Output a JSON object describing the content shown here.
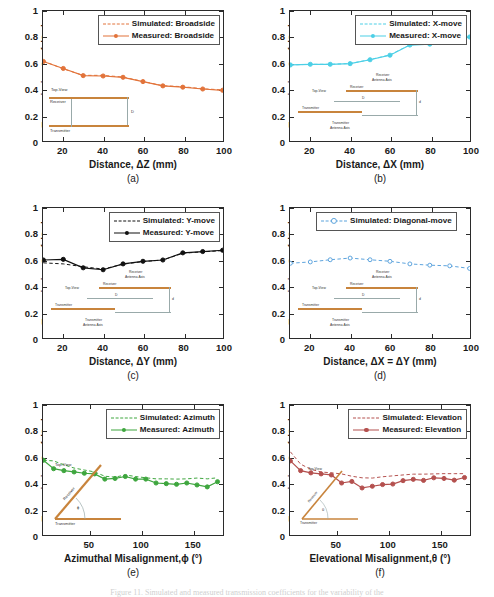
{
  "figure": {
    "ylabel": "Transmission Coef.,|S",
    "ylabel_sub": "21",
    "ylabel_end": "|",
    "caption": "Figure 11. Simulated and measured transmission coefficients for the variability of the"
  },
  "chart_data": [
    {
      "type": "line",
      "panel": "a",
      "panel_label": "(a)",
      "title": "",
      "xlabel": "Distance, ΔZ (mm)",
      "ylabel": "Transmission Coef.,|S21|",
      "xlim": [
        10,
        100
      ],
      "ylim": [
        0,
        1
      ],
      "xticks": [
        20,
        40,
        60,
        80,
        100
      ],
      "yticks": [
        0,
        0.2,
        0.4,
        0.6,
        0.8,
        1
      ],
      "x": [
        10,
        20,
        30,
        40,
        50,
        60,
        70,
        80,
        90,
        100
      ],
      "legend_position": "top-right",
      "color_measured": "#E2733A",
      "color_simulated": "#E2733A",
      "series": [
        {
          "name": "Simulated: Broadside",
          "style": "dashed",
          "marker": "none",
          "values": [
            0.615,
            0.555,
            0.505,
            0.505,
            0.492,
            0.458,
            0.425,
            0.418,
            0.402,
            0.393
          ]
        },
        {
          "name": "Measured: Broadside",
          "style": "solid",
          "marker": "filled-circle",
          "values": [
            0.612,
            0.558,
            0.503,
            0.5,
            0.49,
            0.457,
            0.424,
            0.414,
            0.4,
            0.39
          ]
        }
      ],
      "inset": {
        "labels": [
          "Top-View",
          "Receiver",
          "D",
          "Transmitter"
        ]
      }
    },
    {
      "type": "line",
      "panel": "b",
      "panel_label": "(b)",
      "xlabel": "Distance, ΔX (mm)",
      "ylabel": "Transmission Coef.,|S21|",
      "xlim": [
        10,
        100
      ],
      "ylim": [
        0,
        1
      ],
      "xticks": [
        20,
        40,
        60,
        80,
        100
      ],
      "yticks": [
        0,
        0.2,
        0.4,
        0.6,
        0.8,
        1
      ],
      "x": [
        10,
        20,
        30,
        40,
        50,
        60,
        70,
        80,
        90,
        100
      ],
      "legend_position": "top-right",
      "color_measured": "#4CCFE6",
      "color_simulated": "#4CCFE6",
      "series": [
        {
          "name": "Simulated: X-move",
          "style": "dashed",
          "marker": "none",
          "values": [
            0.585,
            0.59,
            0.59,
            0.596,
            0.626,
            0.662,
            0.74,
            0.748,
            0.806,
            0.8
          ]
        },
        {
          "name": "Measured: X-move",
          "style": "solid",
          "marker": "filled-circle",
          "values": [
            0.585,
            0.59,
            0.59,
            0.595,
            0.625,
            0.66,
            0.738,
            0.745,
            0.805,
            0.8
          ]
        }
      ],
      "inset": {
        "labels": [
          "Top-View",
          "Receiver Antenna Axis",
          "Receiver",
          "D",
          "Transmitter",
          "Transmitter Antenna Axis",
          "d"
        ]
      }
    },
    {
      "type": "line",
      "panel": "c",
      "panel_label": "(c)",
      "xlabel": "Distance, ΔY (mm)",
      "ylabel": "Transmission Coef.,|S21|",
      "xlim": [
        10,
        100
      ],
      "ylim": [
        0,
        1
      ],
      "xticks": [
        20,
        40,
        60,
        80,
        100
      ],
      "yticks": [
        0,
        0.2,
        0.4,
        0.6,
        0.8,
        1
      ],
      "x": [
        10,
        20,
        30,
        40,
        50,
        60,
        70,
        80,
        90,
        100
      ],
      "legend_position": "top-right",
      "color_measured": "#111111",
      "color_simulated": "#111111",
      "series": [
        {
          "name": "Simulated: Y-move",
          "style": "dashed",
          "marker": "none",
          "values": [
            0.578,
            0.57,
            0.548,
            0.53,
            0.568,
            0.588,
            0.6,
            0.652,
            0.663,
            0.672
          ]
        },
        {
          "name": "Measured: Y-move",
          "style": "solid",
          "marker": "filled-circle",
          "values": [
            0.6,
            0.605,
            0.54,
            0.525,
            0.57,
            0.59,
            0.6,
            0.655,
            0.665,
            0.675
          ]
        }
      ],
      "inset": {
        "labels": [
          "Top-View",
          "Receiver Antenna Axis",
          "Receiver",
          "D",
          "Transmitter",
          "Transmitter Antenna Axis",
          "d"
        ]
      }
    },
    {
      "type": "line",
      "panel": "d",
      "panel_label": "(d)",
      "xlabel": "Distance, ΔX = ΔY (mm)",
      "ylabel": "Transmission Coef.,|S21|",
      "xlim": [
        10,
        100
      ],
      "ylim": [
        0,
        1
      ],
      "xticks": [
        20,
        40,
        60,
        80,
        100
      ],
      "yticks": [
        0,
        0.2,
        0.4,
        0.6,
        0.8,
        1
      ],
      "x": [
        10,
        20,
        30,
        40,
        50,
        60,
        70,
        80,
        90,
        100
      ],
      "legend_position": "top-center",
      "color_simulated": "#5BA3DC",
      "series": [
        {
          "name": "Simulated: Diagonal-move",
          "style": "dashed",
          "marker": "open-circle",
          "values": [
            0.575,
            0.585,
            0.602,
            0.615,
            0.602,
            0.59,
            0.57,
            0.56,
            0.555,
            0.535
          ]
        }
      ],
      "inset": {
        "labels": [
          "Top-View",
          "Receiver Antenna Axis",
          "Receiver",
          "D",
          "Transmitter",
          "Transmitter Antenna Axis",
          "d"
        ]
      }
    },
    {
      "type": "line",
      "panel": "e",
      "panel_label": "(e)",
      "xlabel": "Azimuthal Misalignment,ϕ (°)",
      "ylabel": "Transmission Coef.,|S21|",
      "xlim": [
        5,
        180
      ],
      "ylim": [
        0,
        1
      ],
      "xticks": [
        50,
        100,
        150
      ],
      "yticks": [
        0,
        0.2,
        0.4,
        0.6,
        0.8,
        1
      ],
      "x": [
        5,
        15,
        25,
        35,
        45,
        55,
        65,
        75,
        85,
        95,
        105,
        115,
        125,
        135,
        145,
        155,
        165,
        175
      ],
      "legend_position": "top-right",
      "color_measured": "#3EA63E",
      "color_simulated": "#3EA63E",
      "series": [
        {
          "name": "Simulated: Azimuth",
          "style": "dashed",
          "marker": "none",
          "values": [
            0.575,
            0.57,
            0.54,
            0.515,
            0.5,
            0.485,
            0.452,
            0.445,
            0.462,
            0.45,
            0.44,
            0.432,
            0.432,
            0.43,
            0.432,
            0.438,
            0.432,
            0.44
          ]
        },
        {
          "name": "Measured: Azimuth",
          "style": "solid",
          "marker": "filled-circle",
          "values": [
            0.575,
            0.51,
            0.495,
            0.485,
            0.475,
            0.47,
            0.43,
            0.435,
            0.45,
            0.43,
            0.43,
            0.4,
            0.395,
            0.39,
            0.4,
            0.385,
            0.37,
            0.41
          ]
        }
      ],
      "inset": {
        "labels": [
          "Top-View",
          "Receiver",
          "ϕ",
          "Transmitter"
        ]
      }
    },
    {
      "type": "line",
      "panel": "f",
      "panel_label": "(f)",
      "xlabel": "Elevational Misalignment,θ (°)",
      "ylabel": "Transmission Coef.,|S21|",
      "xlim": [
        5,
        180
      ],
      "ylim": [
        0,
        1
      ],
      "xticks": [
        50,
        100,
        150
      ],
      "yticks": [
        0,
        0.2,
        0.4,
        0.6,
        0.8,
        1
      ],
      "x": [
        5,
        15,
        25,
        35,
        45,
        55,
        65,
        75,
        85,
        95,
        105,
        115,
        125,
        135,
        145,
        155,
        165,
        175
      ],
      "legend_position": "top-right",
      "color_measured": "#B4504E",
      "color_simulated": "#B4504E",
      "series": [
        {
          "name": "Simulated: Elevation",
          "style": "dashed",
          "marker": "none",
          "values": [
            0.64,
            0.545,
            0.505,
            0.485,
            0.478,
            0.47,
            0.452,
            0.44,
            0.438,
            0.448,
            0.455,
            0.462,
            0.468,
            0.468,
            0.47,
            0.472,
            0.472,
            0.472
          ]
        },
        {
          "name": "Measured: Elevation",
          "style": "solid",
          "marker": "filled-circle",
          "values": [
            0.57,
            0.495,
            0.478,
            0.47,
            0.462,
            0.4,
            0.412,
            0.362,
            0.375,
            0.388,
            0.392,
            0.418,
            0.428,
            0.42,
            0.44,
            0.435,
            0.422,
            0.442
          ]
        }
      ],
      "inset": {
        "labels": [
          "Top-View",
          "Receiver",
          "θ",
          "Transmitter"
        ]
      }
    }
  ]
}
